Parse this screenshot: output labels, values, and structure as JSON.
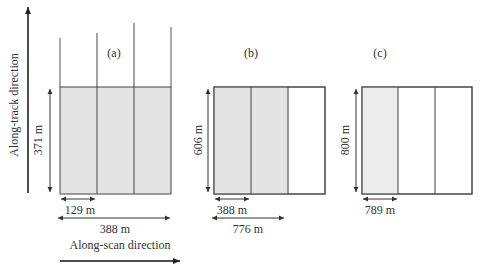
{
  "axes": {
    "vertical_label": "Along-track direction",
    "horizontal_label": "Along-scan direction"
  },
  "panels": [
    {
      "id": "a",
      "label": "(a)",
      "height_label": "371 m",
      "cell_width_label": "129 m",
      "total_width_label": "388 m",
      "shaded_cells": 3
    },
    {
      "id": "b",
      "label": "(b)",
      "height_label": "606 m",
      "cell_width_label": "388 m",
      "total_width_label": "776 m",
      "shaded_cells": 2
    },
    {
      "id": "c",
      "label": "(c)",
      "height_label": "800 m",
      "cell_width_label": "789 m",
      "shaded_cells": 1
    }
  ],
  "colors": {
    "shade": "#e4e4e4",
    "line": "#444444"
  }
}
